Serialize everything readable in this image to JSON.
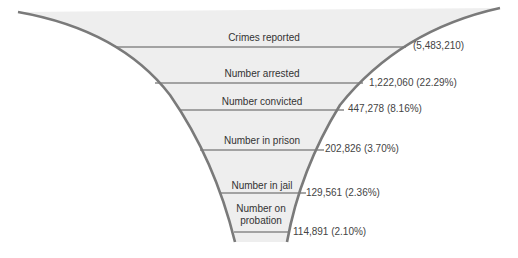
{
  "diagram": {
    "type": "funnel",
    "colors": {
      "fill": "#eeeeee",
      "outline": "#7a7a7a",
      "divider": "#888888",
      "text": "#333333"
    },
    "stages": [
      {
        "label": "Crimes reported",
        "value": "(5,483,210)"
      },
      {
        "label": "Number arrested",
        "value": "1,222,060 (22.29%)"
      },
      {
        "label": "Number convicted",
        "value": "447,278 (8.16%)"
      },
      {
        "label": "Number in prison",
        "value": "202,826 (3.70%)"
      },
      {
        "label": "Number in jail",
        "value": "129,561 (2.36%)"
      },
      {
        "label_line1": "Number on",
        "label_line2": "probation",
        "value": "114,891 (2.10%)"
      }
    ]
  }
}
